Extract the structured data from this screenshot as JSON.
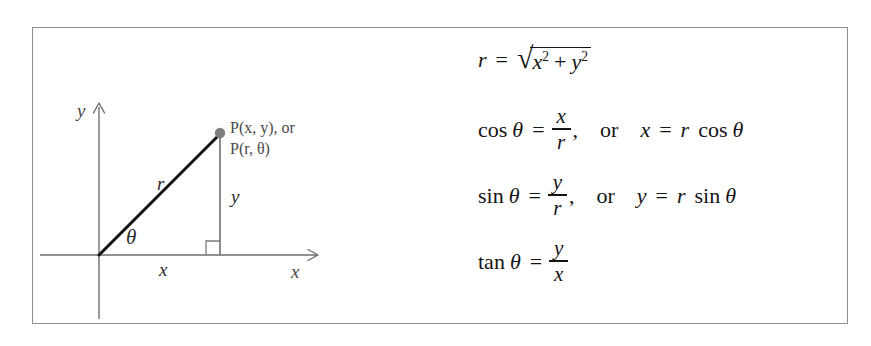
{
  "figure": {
    "kind": "math-textbook-figure",
    "background_color": "#ffffff",
    "frame_color": "#8e8e8e",
    "ink_color": "#141414",
    "diagram_line_color": "#6e6e6e",
    "point_marker_color": "#808080"
  },
  "diagram": {
    "name": "right-triangle-polar-coordinates",
    "axis_labels": {
      "y_axis": "y",
      "x_axis": "x"
    },
    "point_label_line1": "P(x, y), or",
    "point_label_line2": "P(r, θ)",
    "side_labels": {
      "hypotenuse": "r",
      "vertical_leg": "y",
      "horizontal_leg": "x",
      "angle": "θ"
    },
    "right_angle_marker": true,
    "geometry": {
      "origin_x": 67,
      "origin_y": 228,
      "point_x": 188,
      "point_y": 106,
      "x_axis_end": 286,
      "y_axis_top": 76
    }
  },
  "equations": [
    {
      "id": "r-definition",
      "lhs": "r",
      "relation": "=",
      "radicand": "x² + y²",
      "full_text": "r = √(x² + y²)",
      "parts": {
        "var_r": "r",
        "equals": "=",
        "surd": "√",
        "rad_x": "x",
        "rad_x_exp": "2",
        "plus": "+",
        "rad_y": "y",
        "rad_y_exp": "2"
      }
    },
    {
      "id": "cosine-definition",
      "function": "cos",
      "theta": "θ",
      "equals": "=",
      "numerator": "x",
      "denominator": "r",
      "comma": ",",
      "conjunction": "or",
      "alt_lhs": "x",
      "alt_equals": "=",
      "alt_rhs_coefficient": "r",
      "alt_rhs_function": "cos",
      "alt_rhs_theta": "θ",
      "full_text": "cos θ = x/r,   or   x = r cos θ"
    },
    {
      "id": "sine-definition",
      "function": "sin",
      "theta": "θ",
      "equals": "=",
      "numerator": "y",
      "denominator": "r",
      "comma": ",",
      "conjunction": "or",
      "alt_lhs": "y",
      "alt_equals": "=",
      "alt_rhs_coefficient": "r",
      "alt_rhs_function": "sin",
      "alt_rhs_theta": "θ",
      "full_text": "sin θ = y/r,   or   y = r sin θ"
    },
    {
      "id": "tangent-definition",
      "function": "tan",
      "theta": "θ",
      "equals": "=",
      "numerator": "y",
      "denominator": "x",
      "full_text": "tan θ = y/x"
    }
  ]
}
